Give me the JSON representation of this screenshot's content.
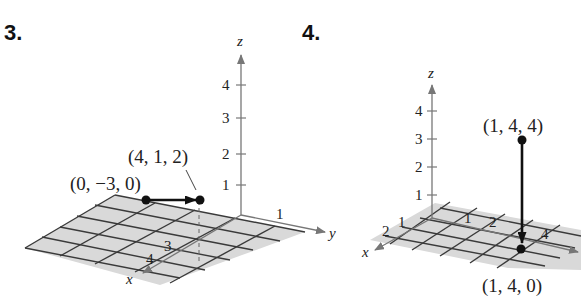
{
  "figures": [
    {
      "number": "3.",
      "axes": {
        "x": "x",
        "y": "y",
        "z": "z"
      },
      "z_ticks": [
        "1",
        "2",
        "3",
        "4"
      ],
      "x_ticks": [
        "3",
        "4"
      ],
      "y_ticks": [
        "1"
      ],
      "vector": {
        "initial_point_label": "(0, −3, 0)",
        "terminal_point_label": "(4, 1, 2)"
      }
    },
    {
      "number": "4.",
      "axes": {
        "x": "x",
        "y": "y",
        "z": "z"
      },
      "z_ticks": [
        "1",
        "2",
        "3",
        "4"
      ],
      "x_ticks": [
        "1",
        "2"
      ],
      "y_ticks": [
        "1",
        "2",
        "4"
      ],
      "vector": {
        "initial_point_label": "(1, 4, 4)",
        "terminal_point_label": "(1, 4, 0)"
      }
    }
  ],
  "colors": {
    "plane": "#d9d9d9",
    "grid": "#3a3a3a",
    "axis": "#777777",
    "vector": "#111111"
  }
}
